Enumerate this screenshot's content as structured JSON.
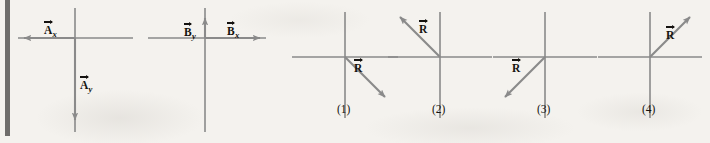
{
  "figure": {
    "type": "vector-addition-multiple-choice",
    "background_color": "#f4f2ee",
    "line_color": "#8a8a8a",
    "label_color": "#14120f",
    "given_panels": [
      {
        "id": "panel-a",
        "center_x": 75,
        "center_y": 38,
        "axes": {
          "x_left": 18,
          "x_right": 133,
          "y_top": 8,
          "y_bottom": 132
        },
        "vectors": [
          {
            "name": "A-x",
            "symbol": "A",
            "subscript": "x",
            "direction": "left",
            "from_x": 75,
            "from_y": 38,
            "to_x": 22,
            "to_y": 38,
            "label_x": 44,
            "label_y": 25
          },
          {
            "name": "A-y",
            "symbol": "A",
            "subscript": "y",
            "direction": "down",
            "from_x": 75,
            "from_y": 38,
            "to_x": 75,
            "to_y": 122,
            "label_x": 80,
            "label_y": 80
          }
        ]
      },
      {
        "id": "panel-b",
        "center_x": 205,
        "center_y": 38,
        "axes": {
          "x_left": 148,
          "x_right": 266,
          "y_top": 8,
          "y_bottom": 132
        },
        "vectors": [
          {
            "name": "B-y",
            "symbol": "B",
            "subscript": "y",
            "direction": "up",
            "from_x": 205,
            "from_y": 38,
            "to_x": 205,
            "to_y": 16,
            "label_x": 185,
            "label_y": 28
          },
          {
            "name": "B-x",
            "symbol": "B",
            "subscript": "x",
            "direction": "right",
            "from_x": 205,
            "from_y": 38,
            "to_x": 262,
            "to_y": 38,
            "label_x": 227,
            "label_y": 26
          }
        ]
      }
    ],
    "choices": [
      {
        "id": "choice-1",
        "label": "(1)",
        "label_x": 337,
        "label_y": 110,
        "center_x": 345,
        "center_y": 57,
        "axes": {
          "x_left": 292,
          "x_right": 398,
          "y_top": 12,
          "y_bottom": 118
        },
        "resultant": {
          "name": "R",
          "symbol": "R",
          "quadrant": 4,
          "direction": "down-right",
          "from_x": 345,
          "from_y": 57,
          "to_x": 387,
          "to_y": 99,
          "label_x": 354,
          "label_y": 67
        }
      },
      {
        "id": "choice-2",
        "label": "(2)",
        "label_x": 432,
        "label_y": 110,
        "center_x": 440,
        "center_y": 57,
        "axes": {
          "x_left": 388,
          "x_right": 492,
          "y_top": 12,
          "y_bottom": 118
        },
        "resultant": {
          "name": "R",
          "symbol": "R",
          "quadrant": 2,
          "direction": "up-left",
          "from_x": 440,
          "from_y": 57,
          "to_x": 398,
          "to_y": 15,
          "label_x": 419,
          "label_y": 25
        }
      },
      {
        "id": "choice-3",
        "label": "(3)",
        "label_x": 537,
        "label_y": 110,
        "center_x": 545,
        "center_y": 57,
        "axes": {
          "x_left": 493,
          "x_right": 597,
          "y_top": 12,
          "y_bottom": 118
        },
        "resultant": {
          "name": "R",
          "symbol": "R",
          "quadrant": 3,
          "direction": "down-left",
          "from_x": 545,
          "from_y": 57,
          "to_x": 503,
          "to_y": 99,
          "label_x": 512,
          "label_y": 67
        }
      },
      {
        "id": "choice-4",
        "label": "(4)",
        "label_x": 642,
        "label_y": 110,
        "center_x": 650,
        "center_y": 57,
        "axes": {
          "x_left": 598,
          "x_right": 702,
          "y_top": 12,
          "y_bottom": 118
        },
        "resultant": {
          "name": "R",
          "symbol": "R",
          "quadrant": 1,
          "direction": "up-right",
          "from_x": 650,
          "from_y": 57,
          "to_x": 692,
          "to_y": 15,
          "label_x": 666,
          "label_y": 32
        }
      }
    ]
  }
}
